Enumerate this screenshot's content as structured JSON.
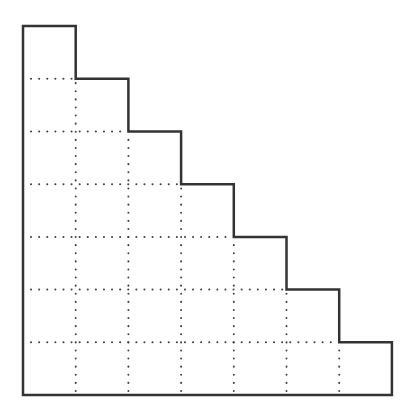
{
  "diagram": {
    "type": "staircase",
    "rows": 7,
    "columns": 7,
    "column_heights": [
      7,
      6,
      5,
      4,
      3,
      2,
      1
    ],
    "total_cells": 28,
    "origin": [
      23,
      395
    ],
    "cell_size": 52.7,
    "outline_color": "#333333",
    "outline_width": 2.5,
    "grid_color": "#444444",
    "grid_style": "dotted",
    "background": "#ffffff"
  }
}
